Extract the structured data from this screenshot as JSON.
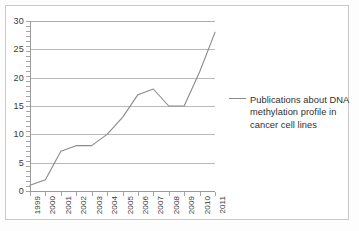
{
  "chart_data": {
    "type": "line",
    "title": "",
    "xlabel": "",
    "ylabel": "",
    "categories": [
      "1999",
      "2000",
      "2001",
      "2002",
      "2003",
      "2004",
      "2005",
      "2006",
      "2007",
      "2008",
      "2009",
      "2010",
      "2011"
    ],
    "series": [
      {
        "name": "Publications about DNA methylation profile in cancer cell lines",
        "values": [
          1,
          2,
          7,
          8,
          8,
          10,
          13,
          17,
          18,
          15,
          15,
          21,
          28
        ],
        "color": "#8a8a8a"
      }
    ],
    "ylim": [
      0,
      30
    ],
    "yticks": [
      0,
      5,
      10,
      15,
      20,
      25,
      30
    ],
    "ytick_labels": [
      "0",
      "5",
      "10",
      "15",
      "20",
      "25",
      "30"
    ],
    "grid": true,
    "grid_axis": "y",
    "legend_position": "right",
    "xtick_rotation": 90
  },
  "legend": {
    "entry_label": "Publications about DNA methylation profile in cancer cell lines"
  },
  "colors": {
    "series_line": "#8a8a8a",
    "gridline": "#b9b9b9",
    "axis": "#9a9a9a",
    "frame_border": "#c9c9c9",
    "tick_text": "#3a3a3a",
    "legend_text": "#2f2f2f",
    "background": "#ffffff"
  }
}
